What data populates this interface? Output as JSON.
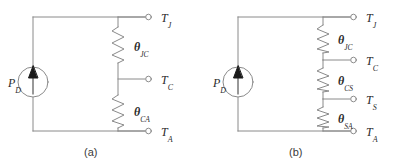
{
  "figure": {
    "background_color": "#ffffff",
    "line_color": "#8a8a8a",
    "text_color": "#2b2b2b"
  },
  "subfigures": [
    {
      "caption": "(a)",
      "source": {
        "name": "P_D",
        "symbol": "P",
        "subscript": "D",
        "type": "current-source"
      },
      "nodes": [
        {
          "name": "T_J",
          "symbol": "T",
          "subscript": "J"
        },
        {
          "name": "T_C",
          "symbol": "T",
          "subscript": "C"
        },
        {
          "name": "T_A",
          "symbol": "T",
          "subscript": "A"
        }
      ],
      "resistors": [
        {
          "name": "theta_JC",
          "symbol": "θ",
          "subscript": "JC"
        },
        {
          "name": "theta_CA",
          "symbol": "θ",
          "subscript": "CA"
        }
      ]
    },
    {
      "caption": "(b)",
      "source": {
        "name": "P_D",
        "symbol": "P",
        "subscript": "D",
        "type": "current-source"
      },
      "nodes": [
        {
          "name": "T_J",
          "symbol": "T",
          "subscript": "J"
        },
        {
          "name": "T_C",
          "symbol": "T",
          "subscript": "C"
        },
        {
          "name": "T_S",
          "symbol": "T",
          "subscript": "S"
        },
        {
          "name": "T_A",
          "symbol": "T",
          "subscript": "A"
        }
      ],
      "resistors": [
        {
          "name": "theta_JC",
          "symbol": "θ",
          "subscript": "JC"
        },
        {
          "name": "theta_CS",
          "symbol": "θ",
          "subscript": "CS"
        },
        {
          "name": "theta_SA",
          "symbol": "θ",
          "subscript": "SA"
        }
      ]
    }
  ]
}
